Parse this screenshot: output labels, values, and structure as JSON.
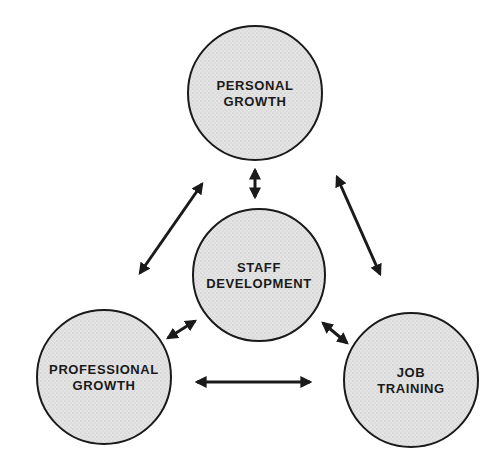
{
  "diagram": {
    "type": "hub-and-spoke relationship diagram",
    "colors": {
      "background": "#ffffff",
      "circle_fill": "#dcdcdc",
      "circle_stroke": "#1a1a1a",
      "arrow": "#1a1a1a",
      "text": "#1a1a1a"
    },
    "nodes": [
      {
        "id": "personal",
        "lines": [
          "PERSONAL",
          "GROWTH"
        ],
        "cx": 255,
        "cy": 93,
        "r": 67
      },
      {
        "id": "staff",
        "lines": [
          "STAFF",
          "DEVELOPMENT"
        ],
        "cx": 259,
        "cy": 275,
        "r": 66
      },
      {
        "id": "professional",
        "lines": [
          "PROFESSIONAL",
          "GROWTH"
        ],
        "cx": 104,
        "cy": 377,
        "r": 67
      },
      {
        "id": "job",
        "lines": [
          "JOB",
          "TRAINING"
        ],
        "cx": 411,
        "cy": 380,
        "r": 67
      }
    ],
    "edges": [
      {
        "from": "personal",
        "to": "staff",
        "type": "bidirectional",
        "x1": 255,
        "y1": 170,
        "x2": 255,
        "y2": 197
      },
      {
        "from": "personal",
        "to": "professional",
        "type": "bidirectional",
        "x1": 202,
        "y1": 184,
        "x2": 140,
        "y2": 273
      },
      {
        "from": "personal",
        "to": "job",
        "type": "bidirectional",
        "x1": 337,
        "y1": 177,
        "x2": 380,
        "y2": 274
      },
      {
        "from": "staff",
        "to": "professional",
        "type": "bidirectional",
        "x1": 195,
        "y1": 321,
        "x2": 168,
        "y2": 338
      },
      {
        "from": "staff",
        "to": "job",
        "type": "bidirectional",
        "x1": 323,
        "y1": 323,
        "x2": 347,
        "y2": 343
      },
      {
        "from": "professional",
        "to": "job",
        "type": "bidirectional",
        "x1": 197,
        "y1": 382,
        "x2": 310,
        "y2": 382
      }
    ]
  }
}
